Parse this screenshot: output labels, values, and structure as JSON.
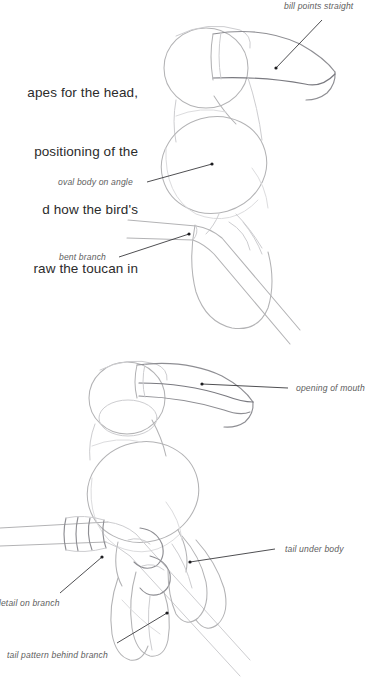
{
  "page": {
    "background_color": "#ffffff",
    "width": 373,
    "height": 687
  },
  "body_copy": {
    "lines": [
      "apes for the head,",
      "positioning of the",
      "d how the bird's",
      "raw the toucan in"
    ],
    "text_color": "#2b2b2b"
  },
  "annotations": {
    "label_color": "#5e5e5e",
    "leader_color": "#2f2f33",
    "items": [
      {
        "id": "bill-points-straight",
        "text": "bill points straight"
      },
      {
        "id": "oval-body-on-angle",
        "text": "oval body on angle"
      },
      {
        "id": "bent-branch",
        "text": "bent branch"
      },
      {
        "id": "opening-of-mouth",
        "text": "opening of mouth"
      },
      {
        "id": "tail-under-body",
        "text": "tail under body"
      },
      {
        "id": "detail-on-branch",
        "text": "detail on branch"
      },
      {
        "id": "tail-pattern-behind-branch",
        "text": "tail pattern behind branch"
      }
    ]
  },
  "figures": [
    {
      "id": "toucan-step-one",
      "caption": ""
    },
    {
      "id": "toucan-step-two",
      "caption": ""
    }
  ],
  "colors": {
    "sketch_light": "#dcdcde",
    "sketch_mid": "#b3b3b5",
    "sketch_dark": "#8e8e93",
    "text": "#2b2b2b",
    "label": "#5e5e5e"
  }
}
